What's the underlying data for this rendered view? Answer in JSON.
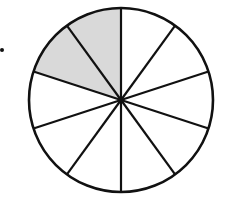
{
  "diagram": {
    "type": "fraction-circle",
    "total_slices": 10,
    "shaded_slices": 2,
    "shaded_indices": [
      8,
      9
    ],
    "center": [
      121,
      100
    ],
    "radius": 92,
    "start_angle_deg": -90,
    "colors": {
      "stroke": "#111111",
      "shaded_fill": "#d9d9d9",
      "unshaded_fill": "#ffffff"
    }
  },
  "bullet": {
    "present": true
  }
}
